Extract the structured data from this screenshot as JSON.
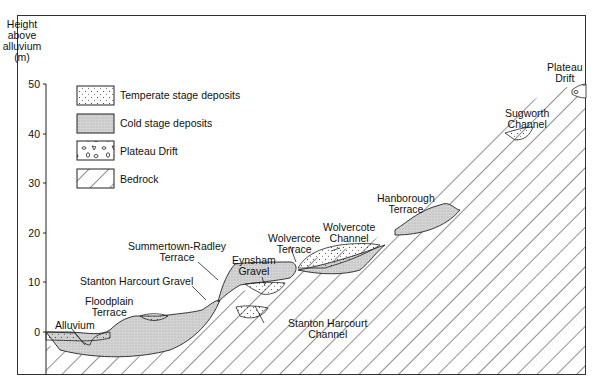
{
  "axis": {
    "title_lines": [
      "Height",
      "above",
      "alluvium",
      "(m)"
    ],
    "ticks": [
      "50",
      "40",
      "30",
      "20",
      "10",
      "0"
    ]
  },
  "legend": [
    {
      "label": "Temperate stage deposits",
      "pattern": "dots"
    },
    {
      "label": "Cold stage deposits",
      "pattern": "grey-stipple"
    },
    {
      "label": "Plateau Drift",
      "pattern": "clasts"
    },
    {
      "label": "Bedrock",
      "pattern": "diagonal-hatch"
    }
  ],
  "labels": {
    "alluvium": "Alluvium",
    "floodplain": [
      "Floodplain",
      "Terrace"
    ],
    "stanton_gravel": "Stanton Harcourt Gravel",
    "summertown": [
      "Summertown-Radley",
      "Terrace"
    ],
    "eynsham": [
      "Eynsham",
      "Gravel"
    ],
    "stanton_channel": [
      "Stanton Harcourt",
      "Channel"
    ],
    "wolvercote_terrace": [
      "Wolvercote",
      "Terrace"
    ],
    "wolvercote_channel": [
      "Wolvercote",
      "Channel"
    ],
    "hanborough": [
      "Hanborough",
      "Terrace"
    ],
    "sugworth": [
      "Sugworth",
      "Channel"
    ],
    "plateau": [
      "Plateau",
      "Drift"
    ]
  },
  "colors": {
    "line": "#222222",
    "cold_fill": "#cfcfcf",
    "background": "#ffffff"
  }
}
